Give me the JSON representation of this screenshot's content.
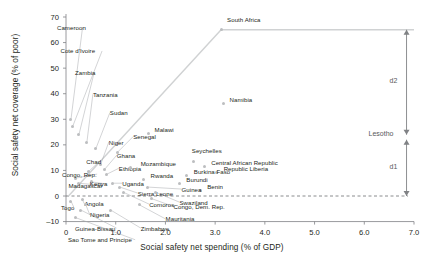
{
  "chart_data": {
    "type": "scatter",
    "title": "",
    "xlabel": "Social safety net spending (% of GDP)",
    "ylabel": "Social safety net coverage (% of poor)",
    "xlim": [
      0,
      7.0
    ],
    "ylim": [
      -10,
      70
    ],
    "xticks": [
      "0",
      "1.0",
      "2.0",
      "3.0",
      "4.0",
      "5.0",
      "6.0",
      "7.0"
    ],
    "yticks": [
      "70",
      "60",
      "50",
      "40",
      "30",
      "20",
      "10",
      "0",
      "-10"
    ],
    "grid": false,
    "legend": null,
    "marker_color": "#bcbec0",
    "frontier_color": "#d0d2d3",
    "annotation_color": "#808285",
    "baseline_value": 0,
    "frontier": {
      "description": "efficiency frontier from origin through South Africa then flat to right edge",
      "points": [
        [
          0.05,
          0.0
        ],
        [
          3.12,
          65.0
        ],
        [
          7.0,
          65.0
        ]
      ]
    },
    "annotations": [
      {
        "name": "d2",
        "label": "d2",
        "x": 6.85,
        "from_y": 65.0,
        "to_y": 24.0
      },
      {
        "name": "Lesotho",
        "label": "Lesotho",
        "x": 6.85,
        "y": 24.0
      },
      {
        "name": "d1",
        "label": "d1",
        "x": 6.85,
        "from_y": 22.0,
        "to_y": 0.0
      }
    ],
    "points": [
      {
        "label": "South Africa",
        "x": 3.12,
        "y": 65.0
      },
      {
        "label": "Namibia",
        "x": 3.17,
        "y": 36.0
      },
      {
        "label": "Cameroon",
        "x": 0.1,
        "y": 30.0
      },
      {
        "label": "Cote d'Ivoire",
        "x": 0.13,
        "y": 27.0
      },
      {
        "label": "Zambia",
        "x": 0.26,
        "y": 24.0
      },
      {
        "label": "Tanzania",
        "x": 0.42,
        "y": 21.0
      },
      {
        "label": "Sudan",
        "x": 0.6,
        "y": 18.5
      },
      {
        "label": "Malawi",
        "x": 1.66,
        "y": 24.5
      },
      {
        "label": "Senegal",
        "x": 1.03,
        "y": 17.0
      },
      {
        "label": "Seychelles",
        "x": 2.57,
        "y": 13.5
      },
      {
        "label": "Central African Republic",
        "x": 2.78,
        "y": 11.5
      },
      {
        "label": "Republic Liberia",
        "x": 3.03,
        "y": 9.0
      },
      {
        "label": "Niger",
        "x": 0.7,
        "y": 12.5
      },
      {
        "label": "Ghana",
        "x": 0.78,
        "y": 10.5
      },
      {
        "label": "Ethiopia",
        "x": 0.82,
        "y": 8.5
      },
      {
        "label": "Chad",
        "x": 0.45,
        "y": 9.5
      },
      {
        "label": "Mozambique",
        "x": 1.3,
        "y": 11.0
      },
      {
        "label": "Burkina Faso",
        "x": 2.43,
        "y": 8.0
      },
      {
        "label": "Rwanda",
        "x": 1.56,
        "y": 6.5
      },
      {
        "label": "Burundi",
        "x": 2.28,
        "y": 5.0
      },
      {
        "label": "Benin",
        "x": 2.7,
        "y": 2.0
      },
      {
        "label": "Congo, Rep.",
        "x": 0.2,
        "y": 7.0
      },
      {
        "label": "Madagascar",
        "x": 0.25,
        "y": 5.0
      },
      {
        "label": "Kenya",
        "x": 0.52,
        "y": 5.5
      },
      {
        "label": "Uganda",
        "x": 0.93,
        "y": 5.0
      },
      {
        "label": "Sierra Leone",
        "x": 1.08,
        "y": 3.5
      },
      {
        "label": "Guinea",
        "x": 1.64,
        "y": 3.5
      },
      {
        "label": "Comoros",
        "x": 1.15,
        "y": 1.5
      },
      {
        "label": "Swaziland",
        "x": 1.8,
        "y": 1.5
      },
      {
        "label": "Togo",
        "x": 0.1,
        "y": -2.0
      },
      {
        "label": "Angola",
        "x": 0.33,
        "y": -1.5
      },
      {
        "label": "Nigeria",
        "x": 0.4,
        "y": -3.5
      },
      {
        "label": "Guinea-Bissau",
        "x": 0.3,
        "y": -5.5
      },
      {
        "label": "Zimbabwe",
        "x": 0.9,
        "y": -5.5
      },
      {
        "label": "Congo, Dem. Rep.",
        "x": 1.72,
        "y": -1.0
      },
      {
        "label": "Mauritania",
        "x": 1.48,
        "y": -3.5
      },
      {
        "label": "Sao Tome and Principe",
        "x": 0.2,
        "y": -8.5
      }
    ]
  }
}
